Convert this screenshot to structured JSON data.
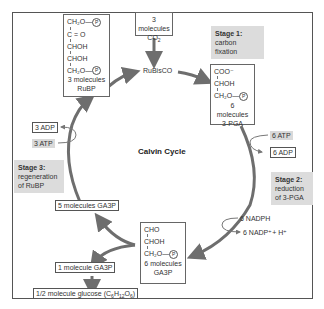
{
  "diagram": {
    "title": "Calvin Cycle",
    "stages": [
      {
        "heading": "Stage 1:",
        "desc": [
          "carbon fixation"
        ]
      },
      {
        "heading": "Stage 2:",
        "desc": [
          "reduction",
          "of 3-PGA"
        ]
      },
      {
        "heading": "Stage 3:",
        "desc": [
          "regeneration",
          "of RuBP"
        ]
      }
    ],
    "co2": {
      "line1": "3 molecules",
      "line2": "CO",
      "sub": "2"
    },
    "enzyme": "RuBisCO",
    "rubp": {
      "lines": [
        "CH₂O—",
        "C = O",
        "CHOH",
        "CHOH",
        "CH₂O—"
      ],
      "phosphate": "P",
      "caption1": "3 molecules",
      "caption2": "RuBP"
    },
    "pga": {
      "lines": [
        "COO⁻",
        "CHOH",
        "CH₂O—"
      ],
      "phosphate": "P",
      "caption1": "6 molecules",
      "caption2": "3-PGA"
    },
    "ga3p": {
      "lines": [
        "CHO",
        "CHOH",
        "CH₂O—"
      ],
      "phosphate": "P",
      "caption1": "6 molecules",
      "caption2": "GA3P"
    },
    "inputs": {
      "atp6": "6 ATP",
      "adp6": "6 ADP",
      "nadph6": "6 NADPH",
      "nadp6": "6 NADP⁺+ H⁺",
      "atp3": "3 ATP",
      "adp3": "3 ADP"
    },
    "ga3p5": "5 molecules GA3P",
    "ga3p1": "1 molecule GA3P",
    "glucose": {
      "text": "1/2 molecule glucose (C",
      "formula": [
        "6",
        "H",
        "12",
        "O",
        "6",
        ")"
      ]
    },
    "colors": {
      "arrow": "#6e6e6e",
      "stage_bg": "#dcdcdc",
      "frame": "#555555"
    }
  }
}
